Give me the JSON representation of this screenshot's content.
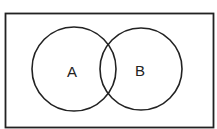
{
  "diagram": {
    "type": "venn",
    "universe": {
      "x": 5,
      "y": 13,
      "width": 209,
      "height": 115
    },
    "sets": [
      {
        "label": "A",
        "cx": 74,
        "cy": 69,
        "r": 42
      },
      {
        "label": "B",
        "cx": 141,
        "cy": 69,
        "r": 41
      }
    ],
    "stroke_color": "#222222"
  }
}
